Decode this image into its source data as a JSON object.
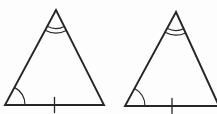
{
  "figure": {
    "background_color": "#fdfdfd",
    "stroke_color": "#262626",
    "canvas": {
      "width": 217,
      "height": 114
    },
    "triangles": [
      {
        "name": "left-triangle",
        "apex": [
          56,
          10
        ],
        "bottom_left": [
          5,
          105
        ],
        "bottom_right": [
          104,
          105
        ],
        "apex_angle_mark": {
          "type": "double-arc",
          "radii": [
            18.5,
            23
          ]
        },
        "bottom_left_angle_mark": {
          "type": "single-arc",
          "radius": 20
        },
        "base_tick_mark": {
          "count": 1,
          "half_length": 7.5
        }
      },
      {
        "name": "right-triangle",
        "apex": [
          176,
          12
        ],
        "bottom_left": [
          125,
          106
        ],
        "bottom_right": [
          219,
          106
        ],
        "apex_angle_mark": {
          "type": "double-arc",
          "radii": [
            18.5,
            23
          ]
        },
        "bottom_left_angle_mark": {
          "type": "single-arc",
          "radius": 20
        },
        "base_tick_mark": {
          "count": 1,
          "half_length": 7.5
        }
      }
    ]
  }
}
